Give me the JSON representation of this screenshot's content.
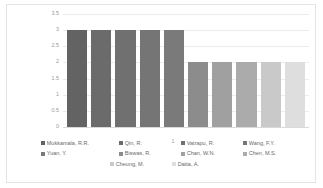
{
  "chart_data": {
    "type": "bar",
    "title": "",
    "xlabel": "",
    "ylabel": "",
    "categories": [
      "1"
    ],
    "x_tick_labels": [
      "1"
    ],
    "y_tick_labels": [
      "3.5",
      "3",
      "2.5",
      "2",
      "1.5",
      "1",
      "0.5",
      "0"
    ],
    "ylim": [
      0,
      3.5
    ],
    "y_tick_step": 0.5,
    "grid": true,
    "legend_position": "bottom",
    "series": [
      {
        "name": "Mukkamala, R.R.",
        "values": [
          3
        ],
        "color": "#636363"
      },
      {
        "name": "Qin, R.",
        "values": [
          3
        ],
        "color": "#6b6b6b"
      },
      {
        "name": "Vatrapu, R.",
        "values": [
          3
        ],
        "color": "#707070"
      },
      {
        "name": "Wang, F.Y.",
        "values": [
          3
        ],
        "color": "#757575"
      },
      {
        "name": "Yuan, Y.",
        "values": [
          3
        ],
        "color": "#7a7a7a"
      },
      {
        "name": "Biswas, R.",
        "values": [
          2
        ],
        "color": "#8c8c8c"
      },
      {
        "name": "Chan, W.N.",
        "values": [
          2
        ],
        "color": "#a0a0a0"
      },
      {
        "name": "Chen, M.S.",
        "values": [
          2
        ],
        "color": "#ababab"
      },
      {
        "name": "Cheung, M.",
        "values": [
          2
        ],
        "color": "#c9c9c9"
      },
      {
        "name": "Datta, A.",
        "values": [
          2
        ],
        "color": "#dedede"
      }
    ]
  },
  "legend_rows": [
    [
      {
        "label": "Mukkamala, R.R.",
        "color": "#636363",
        "width": 78
      },
      {
        "label": "Qin, R.",
        "color": "#6b6b6b",
        "width": 62
      },
      {
        "label": "Vatrapu, R.",
        "color": "#707070",
        "width": 62
      },
      {
        "label": "Wang, F.Y.",
        "color": "#757575",
        "width": 60
      }
    ],
    [
      {
        "label": "Yuan, Y.",
        "color": "#7a7a7a",
        "width": 78
      },
      {
        "label": "Biswas, R.",
        "color": "#8c8c8c",
        "width": 62
      },
      {
        "label": "Chan, W.N.",
        "color": "#a0a0a0",
        "width": 62
      },
      {
        "label": "Chen, M.S.",
        "color": "#ababab",
        "width": 60
      }
    ],
    [
      {
        "label": "Cheung, M.",
        "color": "#c9c9c9",
        "width": 62
      },
      {
        "label": "Datta, A.",
        "color": "#dedede",
        "width": 62
      }
    ]
  ],
  "colors": {
    "gridline": "#ececec",
    "axis_text": "#9a9a9a",
    "legend_text": "#6a6a6a",
    "frame_border": "#e4e4e4",
    "background": "#ffffff"
  }
}
